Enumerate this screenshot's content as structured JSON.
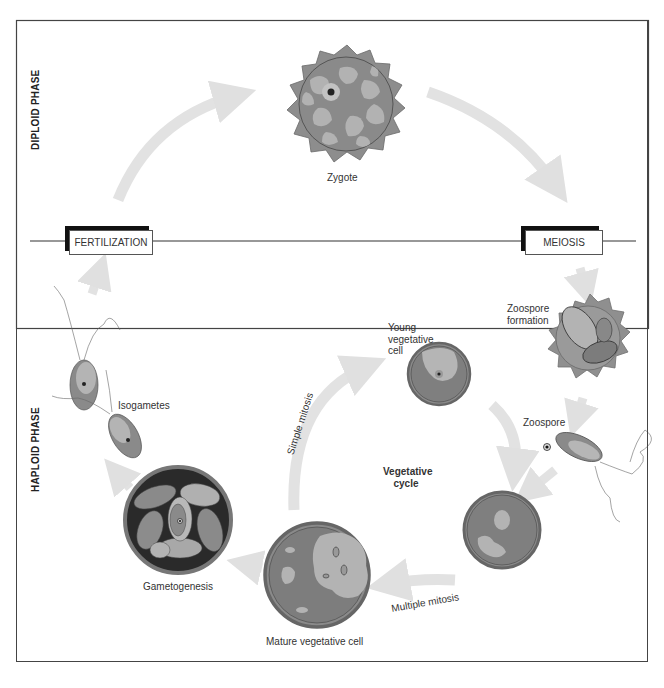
{
  "diagram": {
    "phases": {
      "diploid": "DIPLOID PHASE",
      "haploid": "HAPLOID PHASE"
    },
    "events": {
      "fertilization": "FERTILIZATION",
      "meiosis": "MEIOSIS"
    },
    "stages": {
      "zygote": "Zygote",
      "zoospore_formation_line1": "Zoospore",
      "zoospore_formation_line2": "formation",
      "zoospore": "Zoospore",
      "young_vegetative_line1": "Young",
      "young_vegetative_line2": "vegetative",
      "young_vegetative_line3": "cell",
      "mature_vegetative": "Mature vegetative cell",
      "gametogenesis": "Gametogenesis",
      "isogametes": "Isogametes"
    },
    "processes": {
      "simple_mitosis": "Simple mitosis",
      "multiple_mitosis": "Multiple mitosis",
      "vegetative_cycle_line1": "Vegetative",
      "vegetative_cycle_line2": "cycle"
    },
    "colors": {
      "cell_dark": "#7f7f7f",
      "cell_light": "#b4b4b4",
      "cell_mid": "#9a9a9a",
      "wall": "#8a8a8a",
      "arrow": "#e2e2e2",
      "frame": "#444444"
    }
  }
}
